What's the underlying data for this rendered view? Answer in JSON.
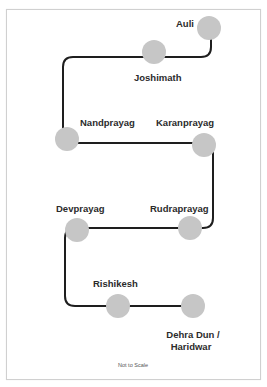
{
  "diagram": {
    "type": "route-map",
    "stations": [
      {
        "id": "auli",
        "name": "Auli"
      },
      {
        "id": "joshimath",
        "name": "Joshimath"
      },
      {
        "id": "nandprayag",
        "name": "Nandprayag"
      },
      {
        "id": "karanprayag",
        "name": "Karanprayag"
      },
      {
        "id": "rudraprayag",
        "name": "Rudraprayag"
      },
      {
        "id": "devprayag",
        "name": "Devprayag"
      },
      {
        "id": "rishikesh",
        "name": "Rishikesh"
      },
      {
        "id": "dehradun-haridwar",
        "name_line1": "Dehra Dun /",
        "name_line2": "Haridwar"
      }
    ],
    "route_order": [
      "Auli",
      "Joshimath",
      "Nandprayag",
      "Karanprayag",
      "Rudraprayag",
      "Devprayag",
      "Rishikesh",
      "Dehra Dun / Haridwar"
    ],
    "note": "Not to Scale"
  },
  "colors": {
    "route_line": "#1e1e1e",
    "station_fill": "#c6c6c6",
    "label_text": "#2b2b2b",
    "frame_border": "#d0d0d0"
  }
}
